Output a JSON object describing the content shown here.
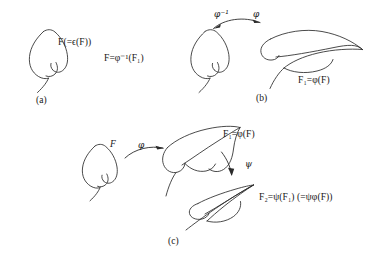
{
  "figure": {
    "caption_panels": [
      "(a)",
      "(b)",
      "(c)"
    ]
  },
  "panel_a": {
    "tag": "(a)",
    "label_leaf": "F(=ϵ(F))",
    "label_right": "F=φ⁻¹(F₁)",
    "shape_name": "leaf-curve-F"
  },
  "panel_b": {
    "tag": "(b)",
    "arrow_left_label": "φ⁻¹",
    "arrow_right_label": "φ",
    "label_result": "F₁=φ(F)",
    "left_shape_name": "leaf-curve-F",
    "right_shape_name": "leaf-curve-F1-stretched"
  },
  "panel_c": {
    "tag": "(c)",
    "label_source": "F",
    "arrow_phi_label": "φ",
    "label_mid": "F₁=φ(F)",
    "arrow_psi_label": "ψ",
    "label_result": "F₂=ψ(F₁) (=ψφ(F))",
    "source_shape_name": "leaf-curve-F",
    "mid_shape_name": "leaf-curve-F1",
    "result_shape_name": "leaf-curve-F2-sheared"
  },
  "colors": {
    "ink": "#2b2b2b",
    "background": "#ffffff",
    "text": "#161616"
  }
}
